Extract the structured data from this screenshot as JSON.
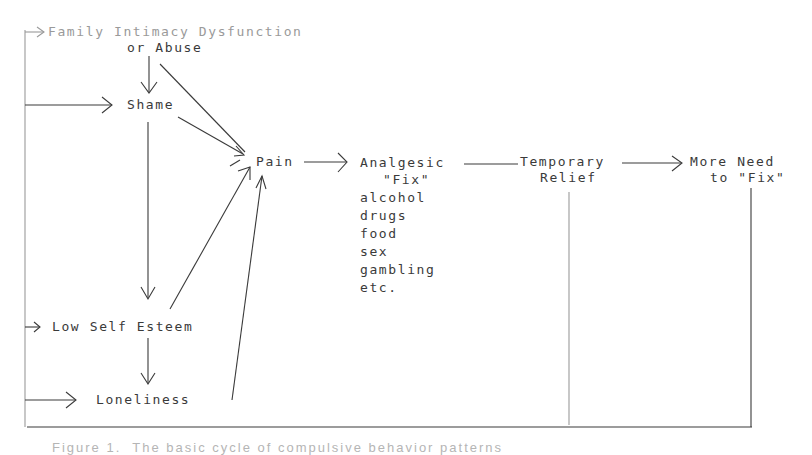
{
  "diagram": {
    "nodes": {
      "family": {
        "line1": "Family Intimacy Dysfunction",
        "line2": "or Abuse"
      },
      "shame": {
        "label": "Shame"
      },
      "low_self_esteem": {
        "label": "Low Self Esteem"
      },
      "loneliness": {
        "label": "Loneliness"
      },
      "pain": {
        "label": "Pain"
      },
      "analgesic": {
        "line1": "Analgesic",
        "line2": "\"Fix\"",
        "examples": [
          "alcohol",
          "drugs",
          "food",
          "sex",
          "gambling",
          "etc."
        ]
      },
      "relief": {
        "line1": "Temporary",
        "line2": "Relief"
      },
      "more_need": {
        "line1": "More Need",
        "line2": "to \"Fix\""
      }
    },
    "edges": [
      {
        "from": "family",
        "to": "shame"
      },
      {
        "from": "family",
        "to": "pain"
      },
      {
        "from": "shame",
        "to": "pain"
      },
      {
        "from": "shame",
        "to": "low_self_esteem"
      },
      {
        "from": "low_self_esteem",
        "to": "pain"
      },
      {
        "from": "low_self_esteem",
        "to": "loneliness"
      },
      {
        "from": "loneliness",
        "to": "pain"
      },
      {
        "from": "pain",
        "to": "analgesic"
      },
      {
        "from": "analgesic",
        "to": "relief"
      },
      {
        "from": "relief",
        "to": "more_need"
      },
      {
        "from": "more_need",
        "to": "feedback-loop",
        "note": "returns via bottom and left lines to Family, Shame, Low Self Esteem, Loneliness"
      }
    ],
    "caption": "Figure 1.  The basic cycle of compulsive behavior patterns",
    "colors": {
      "ink": "#3a3a3a",
      "faint": "#9a9a9a",
      "background": "#ffffff"
    }
  }
}
